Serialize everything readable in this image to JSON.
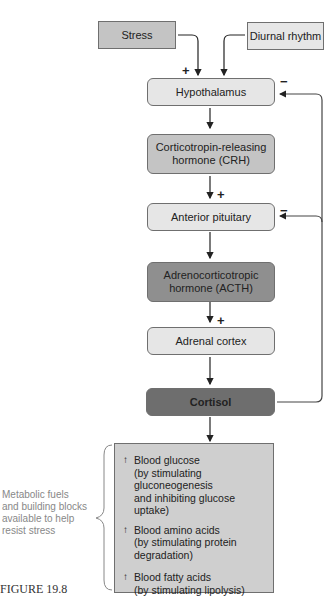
{
  "inputs": {
    "stress": "Stress",
    "diurnal": "Diurnal rhythm"
  },
  "nodes": {
    "hypothalamus": "Hypothalamus",
    "crh_line1": "Corticotropin-releasing",
    "crh_line2": "hormone (CRH)",
    "anterior_pituitary": "Anterior pituitary",
    "acth_line1": "Adrenocorticotropic",
    "acth_line2": "hormone (ACTH)",
    "adrenal_cortex": "Adrenal cortex",
    "cortisol": "Cortisol"
  },
  "signs": {
    "plus": "+",
    "minus": "−"
  },
  "effects": [
    {
      "arrow": "↑",
      "title": "Blood glucose",
      "line2": "(by stimulating gluconeogenesis",
      "line3": "and inhibiting glucose uptake)"
    },
    {
      "arrow": "↑",
      "title": "Blood amino acids",
      "line2": "(by stimulating protein degradation)"
    },
    {
      "arrow": "↑",
      "title": "Blood fatty acids",
      "line2": "(by stimulating lipolysis)"
    }
  ],
  "side_label": {
    "line1": "Metabolic fuels",
    "line2": "and building blocks",
    "line3": "available to help",
    "line4": "resist stress"
  },
  "figure_caption": "FIGURE 19.8"
}
